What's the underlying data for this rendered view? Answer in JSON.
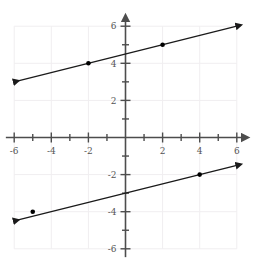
{
  "chart_data": {
    "type": "line",
    "title": "",
    "xlabel": "",
    "ylabel": "",
    "xlim": [
      -6.4,
      6.4
    ],
    "ylim": [
      -6.4,
      6.4
    ],
    "grid": true,
    "grid_step": 2,
    "tick_step": 1,
    "legend": "none",
    "axis_arrows": true,
    "x_tick_labels": [
      "-6",
      "-4",
      "-2",
      "2",
      "4",
      "6"
    ],
    "x_tick_values": [
      -6,
      -4,
      -2,
      2,
      4,
      6
    ],
    "y_tick_labels": [
      "6",
      "4",
      "2",
      "-2",
      "-4",
      "-6"
    ],
    "y_tick_values": [
      6,
      4,
      2,
      -2,
      -4,
      -6
    ],
    "series": [
      {
        "name": "upper-line",
        "slope": 0.25,
        "intercept": 4.5,
        "equation": "y = 0.25x + 4.5",
        "color": "#1a1a1a",
        "x_start": -6.0,
        "x_end": 6.0,
        "arrow_start": true,
        "arrow_end": true,
        "points": [
          {
            "x": -2,
            "y": 4
          },
          {
            "x": 2,
            "y": 5
          }
        ]
      },
      {
        "name": "lower-line",
        "slope": 0.25,
        "intercept": -3.0,
        "equation": "y = 0.25x - 3",
        "color": "#1a1a1a",
        "x_start": -6.0,
        "x_end": 6.0,
        "arrow_start": true,
        "arrow_end": true,
        "points": [
          {
            "x": -5,
            "y": -4
          },
          {
            "x": 4,
            "y": -2
          }
        ]
      }
    ],
    "colors": {
      "grid": "#f0eef0",
      "axis": "#4d4d4d",
      "line": "#1a1a1a",
      "point": "#000000",
      "label": "#555555",
      "background": "#ffffff"
    }
  }
}
